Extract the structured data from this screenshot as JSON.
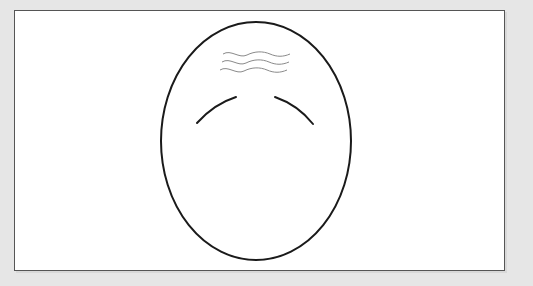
{
  "figure": {
    "colors": {
      "background": "#e6e6e6",
      "panel": "#ffffff",
      "panel_border": "#555555",
      "outline": "#1a1a1a",
      "wrinkles": "#8a8a8a"
    },
    "elements": [
      {
        "name": "head-oval",
        "cx": 256,
        "cy": 141,
        "rx": 95,
        "ry": 119
      },
      {
        "name": "forehead-wrinkles",
        "count": 3
      },
      {
        "name": "eyebrow-left"
      },
      {
        "name": "eyebrow-right"
      }
    ]
  }
}
